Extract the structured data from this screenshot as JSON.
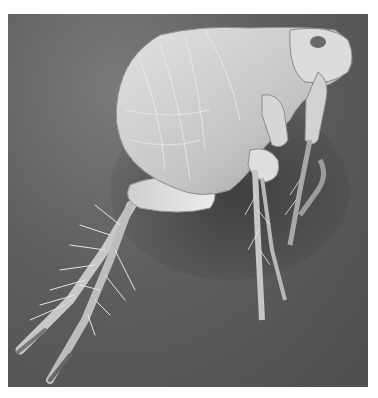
{
  "image": {
    "subject": "flea",
    "description": "Grayscale scanning electron micrograph of a flea in side profile, head facing right, long bristled hind legs extending down-left",
    "colors": {
      "background": "#5e5e5e",
      "body_light": "#d8d8d8",
      "body_mid": "#b5b5b5",
      "shadow": "#3e3e3e",
      "page": "#ffffff"
    }
  }
}
